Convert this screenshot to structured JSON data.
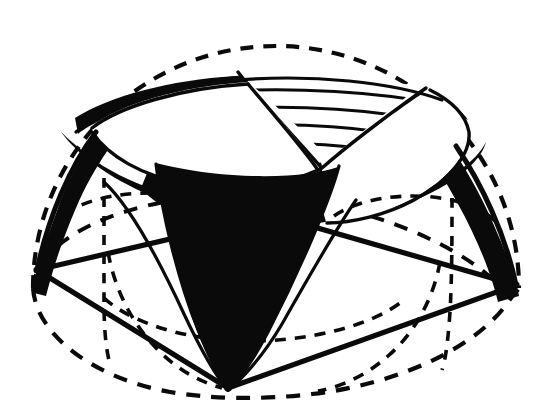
{
  "figure": {
    "canvas": {
      "width": 548,
      "height": 419
    },
    "colors": {
      "ink": "#0a0a0a",
      "paper": "#ffffff"
    },
    "stroke_widths": {
      "outline_dashed": 4.2,
      "frame_solid": 5.0,
      "contour_solid": 3.2,
      "hairline": 2.4
    },
    "dash_patterns": {
      "outer_dome": "13 10",
      "equator": "14 11",
      "hidden_curve": "11 9",
      "meridian": "10 9"
    },
    "dome": {
      "center_x": 276,
      "center_y": 287,
      "radius_x": 243,
      "radius_y": 242,
      "equator_ry": 74
    },
    "rim": {
      "center_x": 272,
      "center_y": 128,
      "radius_x": 197,
      "radius_y": 66
    },
    "vertices": [
      {
        "name": "left-vertex",
        "x": 37,
        "y": 270
      },
      {
        "name": "right-vertex",
        "x": 516,
        "y": 285
      },
      {
        "name": "bottom-vertex",
        "x": 228,
        "y": 388
      }
    ],
    "funnel": {
      "apex_x": 228,
      "apex_y": 388,
      "mouth_left_x": 160,
      "mouth_right_x": 330,
      "mouth_y": 168,
      "stripe_count": 9
    },
    "cusp": {
      "apex_x": 319,
      "apex_y": 160,
      "left_x": 243,
      "right_x": 418,
      "top_y": 72,
      "stratum_count": 6
    },
    "bands": [
      {
        "name": "left-band",
        "stripe_count": 11
      },
      {
        "name": "right-band",
        "stripe_count": 12
      }
    ],
    "labels": {
      "figure_caption": "",
      "annotations": []
    }
  }
}
